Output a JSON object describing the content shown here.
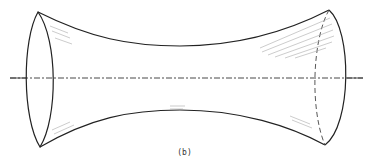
{
  "figure": {
    "caption": "(b)",
    "stroke_color": "#222222",
    "hatch_color": "#aaaaaa",
    "axis_style": "dash-dot"
  }
}
